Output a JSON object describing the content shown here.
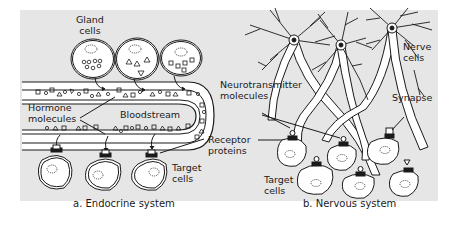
{
  "figure": {
    "background": "#e6e6e6",
    "ink": "#1a1a1a",
    "panels": [
      {
        "id": "a",
        "caption": "a. Endocrine system",
        "labels": {
          "gland_cells": "Gland\ncells",
          "hormone_molecules": "Hormone\nmolecules",
          "bloodstream": "Bloodstream",
          "target_cells": "Target\ncells"
        }
      },
      {
        "id": "b",
        "caption": "b. Nervous system",
        "labels": {
          "nerve_cells": "Nerve\ncells",
          "neurotransmitter_molecules": "Neurotransmitter\nmolecules",
          "synapse": "Synapse",
          "target_cells": "Target\ncells"
        }
      }
    ],
    "shared_labels": {
      "receptor_proteins": "Receptor\nproteins"
    }
  }
}
